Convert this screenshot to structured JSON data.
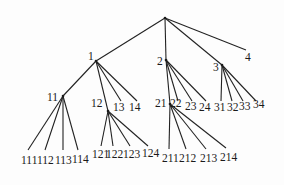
{
  "diagram": {
    "type": "tree",
    "nodes": [
      {
        "id": "root",
        "label": "",
        "x": 165,
        "y": 18
      },
      {
        "id": "1",
        "label": "1",
        "x": 96,
        "y": 61,
        "lx": 88,
        "ly": 51
      },
      {
        "id": "2",
        "label": "2",
        "x": 166,
        "y": 60,
        "lx": 157,
        "ly": 56
      },
      {
        "id": "3",
        "label": "3",
        "x": 222,
        "y": 65,
        "lx": 213,
        "ly": 62
      },
      {
        "id": "4",
        "label": "4",
        "x": 246,
        "y": 50,
        "lx": 245,
        "ly": 52
      },
      {
        "id": "11",
        "label": "11",
        "x": 63,
        "y": 96,
        "lx": 47,
        "ly": 92
      },
      {
        "id": "12",
        "label": "12",
        "x": 108,
        "y": 111,
        "lx": 91,
        "ly": 98
      },
      {
        "id": "13",
        "label": "13",
        "x": 121,
        "y": 101,
        "lx": 113,
        "ly": 102
      },
      {
        "id": "14",
        "label": "14",
        "x": 137,
        "y": 101,
        "lx": 129,
        "ly": 102
      },
      {
        "id": "21",
        "label": "21",
        "x": 170,
        "y": 104,
        "lx": 155,
        "ly": 98
      },
      {
        "id": "22",
        "label": "22",
        "x": 178,
        "y": 101,
        "lx": 170,
        "ly": 98
      },
      {
        "id": "23",
        "label": "23",
        "x": 192,
        "y": 101,
        "lx": 185,
        "ly": 101
      },
      {
        "id": "24",
        "label": "24",
        "x": 206,
        "y": 101,
        "lx": 199,
        "ly": 102
      },
      {
        "id": "31",
        "label": "31",
        "x": 221,
        "y": 101,
        "lx": 214,
        "ly": 102
      },
      {
        "id": "32",
        "label": "32",
        "x": 232,
        "y": 101,
        "lx": 227,
        "ly": 102
      },
      {
        "id": "33",
        "label": "33",
        "x": 243,
        "y": 101,
        "lx": 239,
        "ly": 101
      },
      {
        "id": "34",
        "label": "34",
        "x": 256,
        "y": 101,
        "lx": 253,
        "ly": 99
      },
      {
        "id": "111",
        "label": "111",
        "x": 28,
        "y": 150,
        "lx": 21,
        "ly": 155
      },
      {
        "id": "112",
        "label": "112",
        "x": 45,
        "y": 150,
        "lx": 37,
        "ly": 155
      },
      {
        "id": "113",
        "label": "113",
        "x": 63,
        "y": 150,
        "lx": 55,
        "ly": 155
      },
      {
        "id": "114",
        "label": "114",
        "x": 78,
        "y": 150,
        "lx": 72,
        "ly": 154
      },
      {
        "id": "121",
        "label": "121",
        "x": 101,
        "y": 146,
        "lx": 92,
        "ly": 149
      },
      {
        "id": "122",
        "label": "122",
        "x": 113,
        "y": 146,
        "lx": 106,
        "ly": 149
      },
      {
        "id": "123",
        "label": "123",
        "x": 130,
        "y": 146,
        "lx": 123,
        "ly": 149
      },
      {
        "id": "124",
        "label": "124",
        "x": 148,
        "y": 146,
        "lx": 142,
        "ly": 148
      },
      {
        "id": "211",
        "label": "211",
        "x": 169,
        "y": 149,
        "lx": 162,
        "ly": 153
      },
      {
        "id": "212",
        "label": "212",
        "x": 186,
        "y": 149,
        "lx": 179,
        "ly": 153
      },
      {
        "id": "213",
        "label": "213",
        "x": 206,
        "y": 149,
        "lx": 200,
        "ly": 153
      },
      {
        "id": "214",
        "label": "214",
        "x": 226,
        "y": 148,
        "lx": 220,
        "ly": 152
      }
    ],
    "edges": [
      [
        "root",
        "1"
      ],
      [
        "root",
        "2"
      ],
      [
        "root",
        "3"
      ],
      [
        "root",
        "4"
      ],
      [
        "1",
        "11"
      ],
      [
        "1",
        "12"
      ],
      [
        "1",
        "13"
      ],
      [
        "1",
        "14"
      ],
      [
        "2",
        "21"
      ],
      [
        "2",
        "22"
      ],
      [
        "2",
        "23"
      ],
      [
        "2",
        "24"
      ],
      [
        "3",
        "31"
      ],
      [
        "3",
        "32"
      ],
      [
        "3",
        "33"
      ],
      [
        "3",
        "34"
      ],
      [
        "11",
        "111"
      ],
      [
        "11",
        "112"
      ],
      [
        "11",
        "113"
      ],
      [
        "11",
        "114"
      ],
      [
        "12",
        "121"
      ],
      [
        "12",
        "122"
      ],
      [
        "12",
        "123"
      ],
      [
        "12",
        "124"
      ],
      [
        "21",
        "211"
      ],
      [
        "21",
        "212"
      ],
      [
        "21",
        "213"
      ],
      [
        "21",
        "214"
      ]
    ]
  }
}
